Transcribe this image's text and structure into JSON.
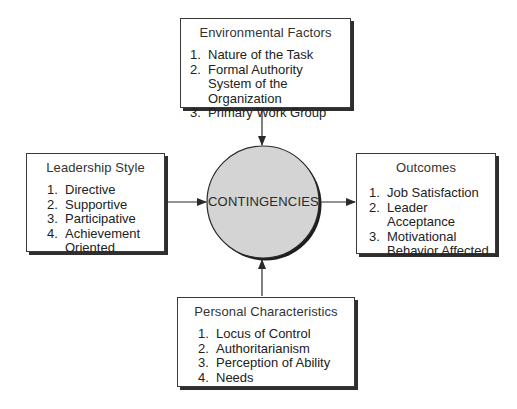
{
  "center": {
    "label": "CONTINGENCIES",
    "fill_color": "#d4d4d4"
  },
  "environmental_factors": {
    "title": "Environmental Factors",
    "items": [
      {
        "num": "1.",
        "text": "Nature of the Task"
      },
      {
        "num": "2.",
        "text": "Formal Authority System of the Organization"
      },
      {
        "num": "3.",
        "text": "Primary Work Group"
      }
    ]
  },
  "leadership_style": {
    "title": "Leadership Style",
    "items": [
      {
        "num": "1.",
        "text": "Directive"
      },
      {
        "num": "2.",
        "text": "Supportive"
      },
      {
        "num": "3.",
        "text": "Participative"
      },
      {
        "num": "4.",
        "text": "Achievement Oriented"
      }
    ]
  },
  "outcomes": {
    "title": "Outcomes",
    "items": [
      {
        "num": "1.",
        "text": "Job Satisfaction"
      },
      {
        "num": "2.",
        "text": "Leader Acceptance"
      },
      {
        "num": "3.",
        "text": "Motivational Behavior Affected"
      }
    ]
  },
  "personal_characteristics": {
    "title": "Personal Characteristics",
    "items": [
      {
        "num": "1.",
        "text": "Locus of Control"
      },
      {
        "num": "2.",
        "text": "Authoritarianism"
      },
      {
        "num": "3.",
        "text": "Perception of Ability"
      },
      {
        "num": "4.",
        "text": "Needs"
      }
    ]
  },
  "edges": [
    {
      "from": "environmental_factors",
      "to": "center"
    },
    {
      "from": "leadership_style",
      "to": "center"
    },
    {
      "from": "personal_characteristics",
      "to": "center"
    },
    {
      "from": "center",
      "to": "outcomes"
    }
  ]
}
